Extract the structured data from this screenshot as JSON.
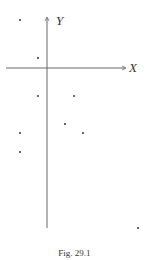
{
  "figure": {
    "caption": "Fig. 29.1",
    "x_axis_label": "X",
    "y_axis_label": "Y"
  },
  "chart_data": {
    "type": "scatter",
    "title": "",
    "xlabel": "X",
    "ylabel": "Y",
    "grid": false,
    "origin_px": [
      47,
      68
    ],
    "points_px": [
      [
        20,
        20
      ],
      [
        38,
        58
      ],
      [
        38,
        96
      ],
      [
        74,
        96
      ],
      [
        65,
        124
      ],
      [
        83,
        133
      ],
      [
        20,
        133
      ],
      [
        20,
        152
      ],
      [
        138,
        228
      ]
    ]
  },
  "colors": {
    "axis": "#555555",
    "point": "#333333",
    "text": "#333333"
  }
}
